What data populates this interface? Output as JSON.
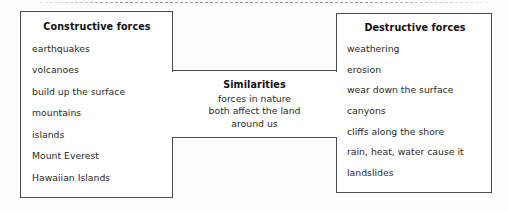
{
  "worksheet": {
    "top_rule": "dashed-rule",
    "left_box": {
      "title": "Constructive forces",
      "items": [
        "earthquakes",
        "volcanoes",
        "build up the surface",
        "mountains",
        "islands",
        "Mount Everest",
        "Hawaiian Islands"
      ]
    },
    "middle_box": {
      "title": "Similarities",
      "lines": [
        "forces in nature",
        "both affect the land",
        "around us"
      ]
    },
    "right_box": {
      "title": "Destructive forces",
      "items": [
        "weathering",
        "erosion",
        "wear down the surface",
        "canyons",
        "cliffs along the shore",
        "rain, heat, water cause it",
        "landslides"
      ]
    }
  },
  "colors": {
    "page_background": "#fdfdfd",
    "box_border": "#4a4a4a",
    "title_text": "#111111",
    "body_text": "#2a2a2a",
    "dashed_rule": "#8c8c8c"
  }
}
